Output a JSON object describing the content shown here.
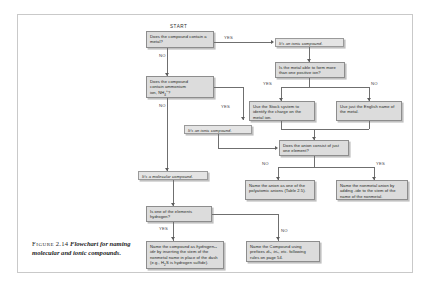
{
  "figure": {
    "caption_label": "Figure",
    "caption_number": "2.14",
    "caption_title": "Flowchart for naming molecular and ionic compounds.",
    "frame_color": "#c9c9c9",
    "box_fill": "#dcdcdc",
    "box_border": "#8d8d8d",
    "connector_color": "#6f6f6f"
  },
  "labels": {
    "start": "START",
    "yes": "YES",
    "no": "NO"
  },
  "nodes": {
    "q_metal": "Does the compound contain a metal?",
    "q_ammonium_line1": "Does the compound",
    "q_ammonium_line2": "contain ammonium",
    "q_ammonium_line3a": "ion, NH",
    "q_ammonium_sub": "4",
    "q_ammonium_sup": "+",
    "q_ammonium_line3b": "?",
    "ionic_top": "It's an ionic compound.",
    "ionic_mid": "It's an ionic compound.",
    "molecular": "It's a molecular compound.",
    "q_positive_ion": "Is the metal able to form more than one positive ion?",
    "stock_system": "Use the Stock system to identify the charge on the metal ion.",
    "english_name": "Use just the English name of the metal.",
    "q_anion_one_element": "Does the anion consist of just one element?",
    "polyatomic": "Name the anion as one of the polyatomic anions (Table 2.5).",
    "nonmetal_anion": "Name the nonmetal anion by adding -ide to the stem of the name of the nonmetal.",
    "q_hydrogen": "Is one of the elements hydrogen?",
    "hydrogen_name_pre": "Name the compound as ",
    "hydrogen_name_italic": "hydrogen--ide",
    "hydrogen_name_mid": " by inserting the stem of the nonmetal name in place of the dash (e.g., H",
    "hydrogen_name_sub": "2",
    "hydrogen_name_post": "S is hydrogen sulfide).",
    "prefix_name_pre": "Name the Compound using prefixes ",
    "prefix_name_italic": "di-, tri-,",
    "prefix_name_post": " etc. following rules on page 54."
  }
}
